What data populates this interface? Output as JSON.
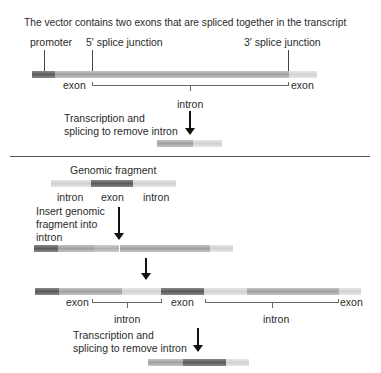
{
  "top": {
    "title": "The vector contains two exons that are spliced together in the transcript",
    "labels": {
      "promoter": "promoter",
      "splice5": "5′ splice junction",
      "splice3": "3′ splice junction",
      "exon_left": "exon",
      "exon_right": "exon",
      "intron": "intron"
    },
    "step": {
      "line1": "Transcription and",
      "line2": "splicing to remove intron"
    }
  },
  "bottom": {
    "fragment_title": "Genomic fragment",
    "fragment_labels": [
      "intron",
      "exon",
      "intron"
    ],
    "insert_step": {
      "line1": "Insert genomic",
      "line2": "fragment into",
      "line3": "intron"
    },
    "recombinant_labels": {
      "exon1": "exon",
      "intron1": "intron",
      "exon2": "exon",
      "intron2": "intron",
      "exon3": "exon"
    },
    "step": {
      "line1": "Transcription and",
      "line2": "splicing to remove intron"
    }
  },
  "colors": {
    "arrow": "#111111",
    "divider": "#555555"
  }
}
